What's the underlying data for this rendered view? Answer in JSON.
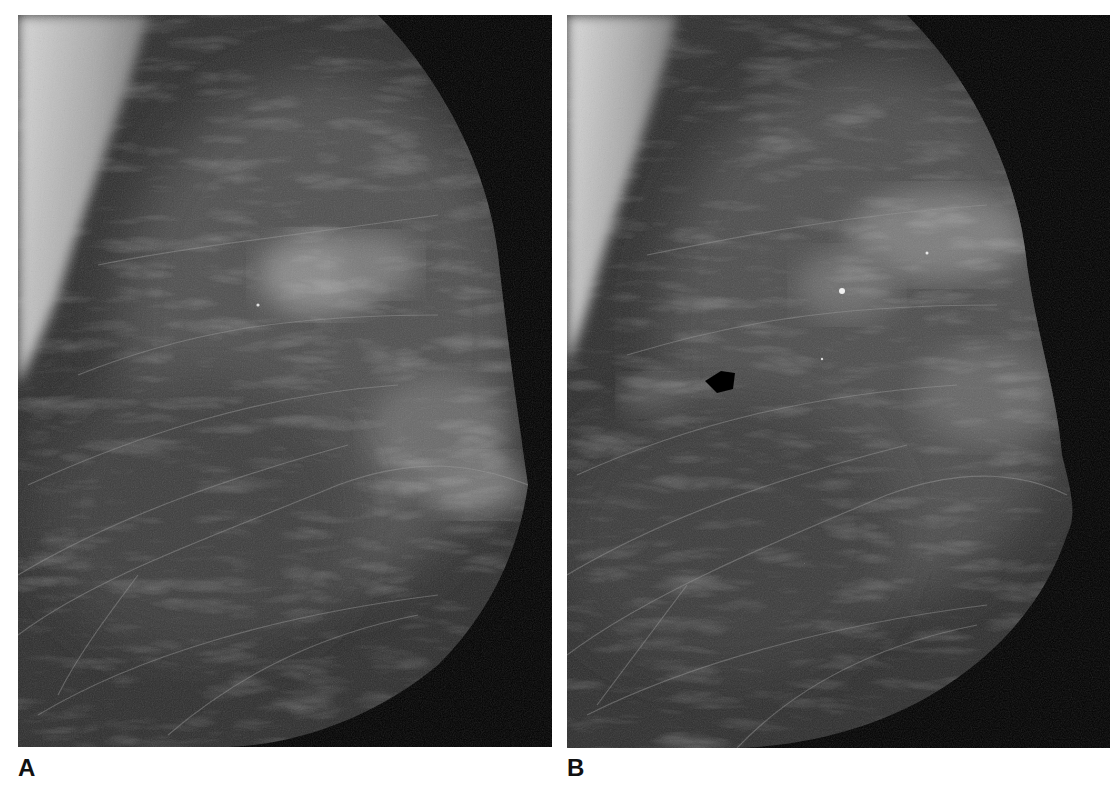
{
  "figure": {
    "panels": [
      {
        "label": "A",
        "description": "Mammogram, mediolateral oblique view, fibroglandular tissue with pectoral muscle at upper left",
        "annotations": []
      },
      {
        "label": "B",
        "description": "Mammogram, mediolateral oblique view, same breast at later exam",
        "annotations": [
          {
            "type": "arrow",
            "color": "#000000",
            "direction": "left",
            "points_to": "focal density"
          }
        ]
      }
    ]
  },
  "colors": {
    "background": "#ffffff",
    "film_black": "#000000",
    "label_text": "#111111"
  }
}
